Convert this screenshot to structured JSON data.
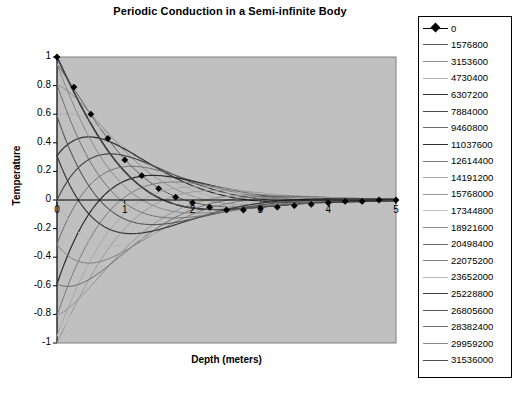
{
  "chart_data": {
    "type": "line",
    "title": "Periodic Conduction in a Semi-infinite Body",
    "xlabel": "Depth (meters)",
    "ylabel": "Temperature",
    "xlim": [
      0,
      5
    ],
    "ylim": [
      -1,
      1
    ],
    "xticks": [
      "0",
      "1",
      "2",
      "3",
      "4",
      "5"
    ],
    "xtick_values": [
      0,
      1,
      2,
      3,
      4,
      5
    ],
    "yticks": [
      "1",
      "0.8",
      "0.6",
      "0.4",
      "0.2",
      "0",
      "-0.2",
      "-0.4",
      "-0.6",
      "-0.8",
      "-1"
    ],
    "ytick_values": [
      1,
      0.8,
      0.6,
      0.4,
      0.2,
      0,
      -0.2,
      -0.4,
      -0.6,
      -0.8,
      -1
    ],
    "grid": false,
    "legend_position": "right",
    "plot_background": "#c0c0c0",
    "plot_border": "#808080",
    "marker_series_index": 0,
    "marker_shape": "diamond",
    "x_axis_line_at_zero": true,
    "model": "T(x,t) = exp(-x*k) * cos(omega*t - x*k)",
    "decay_constant": 1.0,
    "period_seconds": 31536000,
    "series": [
      {
        "name": "0",
        "time": 0,
        "phase_deg": 0,
        "color": "#000000",
        "width": 1.4
      },
      {
        "name": "1576800",
        "time": 1576800,
        "phase_deg": 18,
        "color": "#5a5a5a",
        "width": 1.0
      },
      {
        "name": "3153600",
        "time": 3153600,
        "phase_deg": 36,
        "color": "#8c8c8c",
        "width": 1.0
      },
      {
        "name": "4730400",
        "time": 4730400,
        "phase_deg": 54,
        "color": "#b0b0b0",
        "width": 1.0
      },
      {
        "name": "6307200",
        "time": 6307200,
        "phase_deg": 72,
        "color": "#303030",
        "width": 1.2
      },
      {
        "name": "7884000",
        "time": 7884000,
        "phase_deg": 90,
        "color": "#4a4a4a",
        "width": 1.2
      },
      {
        "name": "9460800",
        "time": 9460800,
        "phase_deg": 108,
        "color": "#6e6e6e",
        "width": 1.0
      },
      {
        "name": "11037600",
        "time": 11037600,
        "phase_deg": 126,
        "color": "#2c2c2c",
        "width": 1.2
      },
      {
        "name": "12614400",
        "time": 12614400,
        "phase_deg": 144,
        "color": "#7a7a7a",
        "width": 1.0
      },
      {
        "name": "14191200",
        "time": 14191200,
        "phase_deg": 162,
        "color": "#a8a8a8",
        "width": 1.0
      },
      {
        "name": "15768000",
        "time": 15768000,
        "phase_deg": 180,
        "color": "#9a9a9a",
        "width": 1.0
      },
      {
        "name": "17344800",
        "time": 17344800,
        "phase_deg": 198,
        "color": "#c2c2c2",
        "width": 1.0
      },
      {
        "name": "18921600",
        "time": 18921600,
        "phase_deg": 216,
        "color": "#8f8f8f",
        "width": 1.0
      },
      {
        "name": "20498400",
        "time": 20498400,
        "phase_deg": 234,
        "color": "#6a6a6a",
        "width": 1.0
      },
      {
        "name": "22075200",
        "time": 22075200,
        "phase_deg": 252,
        "color": "#808080",
        "width": 1.0
      },
      {
        "name": "23652000",
        "time": 23652000,
        "phase_deg": 270,
        "color": "#b8b8b8",
        "width": 1.0
      },
      {
        "name": "25228800",
        "time": 25228800,
        "phase_deg": 288,
        "color": "#3a3a3a",
        "width": 1.2
      },
      {
        "name": "26805600",
        "time": 26805600,
        "phase_deg": 306,
        "color": "#585858",
        "width": 1.1
      },
      {
        "name": "28382400",
        "time": 28382400,
        "phase_deg": 324,
        "color": "#707070",
        "width": 1.0
      },
      {
        "name": "29959200",
        "time": 29959200,
        "phase_deg": 342,
        "color": "#888888",
        "width": 1.0
      },
      {
        "name": "31536000",
        "time": 31536000,
        "phase_deg": 360,
        "color": "#4f4f4f",
        "width": 1.1
      }
    ],
    "marker_points": [
      {
        "x": 0.0,
        "y": 1.0
      },
      {
        "x": 0.25,
        "y": 0.79
      },
      {
        "x": 0.5,
        "y": 0.6
      },
      {
        "x": 0.75,
        "y": 0.43
      },
      {
        "x": 1.0,
        "y": 0.28
      },
      {
        "x": 1.25,
        "y": 0.17
      },
      {
        "x": 1.5,
        "y": 0.08
      },
      {
        "x": 1.75,
        "y": 0.02
      },
      {
        "x": 2.0,
        "y": -0.02
      },
      {
        "x": 2.25,
        "y": -0.05
      },
      {
        "x": 2.5,
        "y": -0.07
      },
      {
        "x": 2.75,
        "y": -0.07
      },
      {
        "x": 3.0,
        "y": -0.06
      },
      {
        "x": 3.25,
        "y": -0.05
      },
      {
        "x": 3.5,
        "y": -0.04
      },
      {
        "x": 3.75,
        "y": -0.03
      },
      {
        "x": 4.0,
        "y": -0.02
      },
      {
        "x": 4.25,
        "y": -0.01
      },
      {
        "x": 4.5,
        "y": -0.01
      },
      {
        "x": 4.75,
        "y": 0.0
      },
      {
        "x": 5.0,
        "y": 0.0
      }
    ]
  }
}
